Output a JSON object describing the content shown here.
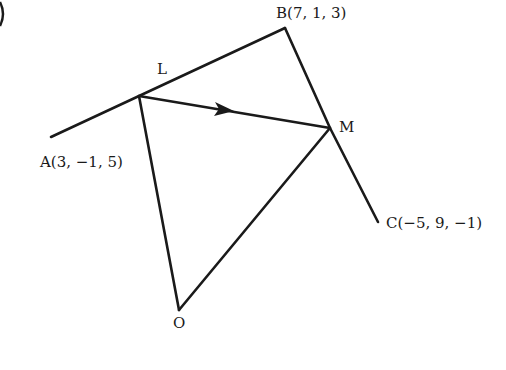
{
  "diagram": {
    "corner_mark": ")",
    "points": {
      "A": {
        "label": "A(3, −1, 5)"
      },
      "B": {
        "label": "B(7, 1, 3)"
      },
      "C": {
        "label": "C(−5, 9, −1)"
      },
      "L": {
        "label": "L"
      },
      "M": {
        "label": "M"
      },
      "O": {
        "label": "O"
      }
    },
    "segments": [
      "A-B",
      "B-C",
      "L-M (arrow)",
      "L-O",
      "M-O"
    ],
    "line_color": "#1a1a1a"
  }
}
